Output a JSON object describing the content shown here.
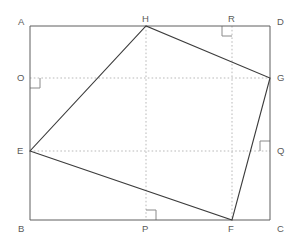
{
  "figure": {
    "canvas": {
      "width": 296,
      "height": 247
    },
    "colors": {
      "rectangle_stroke": "#5f5f5f",
      "quadrilateral_stroke": "#3c3c3c",
      "dotted_stroke": "#b9b9b9",
      "right_angle_stroke": "#8a8a8a",
      "label_text": "#5a5a5a",
      "background": "#ffffff"
    }
  },
  "points": {
    "A": {
      "label": "A",
      "x": 30,
      "y": 26,
      "label_x": 18,
      "label_y": 17
    },
    "B": {
      "label": "B",
      "x": 30,
      "y": 220,
      "label_x": 18,
      "label_y": 224
    },
    "C": {
      "label": "C",
      "x": 270,
      "y": 220,
      "label_x": 277,
      "label_y": 224
    },
    "D": {
      "label": "D",
      "x": 270,
      "y": 26,
      "label_x": 277,
      "label_y": 17
    },
    "E": {
      "label": "E",
      "x": 30,
      "y": 151,
      "label_x": 17,
      "label_y": 146
    },
    "F": {
      "label": "F",
      "x": 232,
      "y": 220,
      "label_x": 228,
      "label_y": 224
    },
    "G": {
      "label": "G",
      "x": 270,
      "y": 78,
      "label_x": 277,
      "label_y": 73
    },
    "H": {
      "label": "H",
      "x": 146,
      "y": 26,
      "label_x": 142,
      "label_y": 14
    },
    "O": {
      "label": "O",
      "x": 30,
      "y": 78,
      "label_x": 17,
      "label_y": 73
    },
    "P": {
      "label": "P",
      "x": 146,
      "y": 220,
      "label_x": 142,
      "label_y": 224
    },
    "Q": {
      "label": "Q",
      "x": 270,
      "y": 151,
      "label_x": 277,
      "label_y": 146
    },
    "R": {
      "label": "R",
      "x": 232,
      "y": 26,
      "label_x": 228,
      "label_y": 14
    }
  },
  "shapes": {
    "rectangle": {
      "name": "rectangle-ABCD",
      "vertices": [
        "A",
        "B",
        "C",
        "D"
      ],
      "path": "M 30 26 L 270 26 L 270 220 L 30 220 Z",
      "stroke_width": 1
    },
    "quadrilateral": {
      "name": "quadrilateral-EFGH",
      "vertices": [
        "E",
        "F",
        "G",
        "H"
      ],
      "path": "M 30 151 L 232 220 L 270 78 L 146 26 Z",
      "stroke_width": 1.1
    }
  },
  "dotted_lines": [
    {
      "name": "dotted-line-O-G",
      "x1": 30,
      "y1": 78,
      "x2": 270,
      "y2": 78
    },
    {
      "name": "dotted-line-E-Q",
      "x1": 30,
      "y1": 151,
      "x2": 270,
      "y2": 151
    },
    {
      "name": "dotted-line-H-P",
      "x1": 146,
      "y1": 26,
      "x2": 146,
      "y2": 220
    },
    {
      "name": "dotted-line-R-F",
      "x1": 232,
      "y1": 26,
      "x2": 232,
      "y2": 220
    }
  ],
  "right_angle_marks": [
    {
      "name": "right-angle-mark-O",
      "at": "O",
      "path": "M 30 88 L 40 88 L 40 78"
    },
    {
      "name": "right-angle-mark-R",
      "at": "R",
      "path": "M 222 26 L 222 36 L 232 36"
    },
    {
      "name": "right-angle-mark-Q",
      "at": "Q",
      "path": "M 270 141 L 260 141 L 260 151"
    },
    {
      "name": "right-angle-mark-P",
      "at": "P",
      "path": "M 146 210 L 156 210 L 156 220"
    }
  ]
}
